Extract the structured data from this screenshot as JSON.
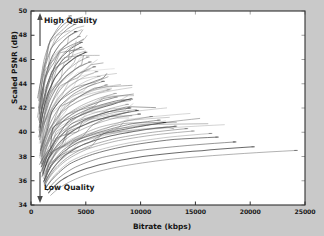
{
  "chart_data": {
    "type": "line",
    "title": "",
    "xlabel": "Bitrate (kbps)",
    "ylabel": "Scaled PSNR (dB)",
    "xlim": [
      0,
      25000
    ],
    "ylim": [
      34,
      50
    ],
    "xticks": [
      0,
      5000,
      10000,
      15000,
      20000,
      25000
    ],
    "yticks": [
      34,
      36,
      38,
      40,
      42,
      44,
      46,
      48,
      50
    ],
    "xtick_labels": [
      "0",
      "5000",
      "10000",
      "15000",
      "20000",
      "25000"
    ],
    "ytick_labels": [
      "34",
      "36",
      "38",
      "40",
      "42",
      "44",
      "46",
      "48",
      "50"
    ],
    "grid": false,
    "legend": null,
    "legend_position": "none",
    "line_color": "#555555",
    "plot_background": "#ffffff",
    "figure_background": "#c9c9c9",
    "annotations": [
      {
        "text": "High Quality",
        "x": 1400,
        "y": 49.0,
        "arrow": "up"
      },
      {
        "text": "Low Quality",
        "x": 1400,
        "y": 35.6,
        "arrow": "down"
      }
    ],
    "series": [
      {
        "name": "seq-01",
        "x": [
          700,
          900,
          1200,
          1700,
          2300,
          3000,
          3600
        ],
        "y": [
          42.6,
          44.4,
          46.0,
          47.4,
          48.4,
          49.2,
          49.6
        ]
      },
      {
        "name": "seq-02",
        "x": [
          700,
          950,
          1300,
          1800,
          2500,
          3300,
          4000
        ],
        "y": [
          42.0,
          43.8,
          45.4,
          46.8,
          47.8,
          48.5,
          48.9
        ]
      },
      {
        "name": "seq-03",
        "x": [
          750,
          1000,
          1400,
          1900,
          2600,
          3400,
          4100
        ],
        "y": [
          41.5,
          43.3,
          44.9,
          46.2,
          47.2,
          47.9,
          48.3
        ]
      },
      {
        "name": "seq-04",
        "x": [
          700,
          950,
          1350,
          1900,
          2700,
          3600,
          4400
        ],
        "y": [
          41.0,
          42.8,
          44.4,
          45.8,
          46.8,
          47.5,
          47.9
        ]
      },
      {
        "name": "seq-05",
        "x": [
          800,
          1100,
          1500,
          2100,
          2900,
          3800,
          4600
        ],
        "y": [
          40.8,
          42.5,
          44.0,
          45.3,
          46.3,
          47.0,
          47.4
        ]
      },
      {
        "name": "seq-06",
        "x": [
          750,
          1050,
          1450,
          2050,
          2850,
          3750,
          4550
        ],
        "y": [
          40.4,
          42.1,
          43.6,
          44.9,
          45.9,
          46.6,
          47.0
        ]
      },
      {
        "name": "seq-07",
        "x": [
          800,
          1100,
          1550,
          2200,
          3100,
          4100,
          5000
        ],
        "y": [
          40.0,
          41.7,
          43.2,
          44.5,
          45.5,
          46.2,
          46.6
        ]
      },
      {
        "name": "seq-08",
        "x": [
          850,
          1200,
          1700,
          2400,
          3300,
          4300,
          5200
        ],
        "y": [
          39.7,
          41.4,
          42.9,
          44.1,
          45.1,
          45.8,
          46.2
        ]
      },
      {
        "name": "seq-09",
        "x": [
          800,
          1150,
          1650,
          2350,
          3300,
          4400,
          5400
        ],
        "y": [
          39.4,
          41.0,
          42.5,
          43.7,
          44.7,
          45.4,
          45.8
        ]
      },
      {
        "name": "seq-10",
        "x": [
          850,
          1200,
          1750,
          2500,
          3500,
          4700,
          5800
        ],
        "y": [
          39.1,
          40.7,
          42.1,
          43.3,
          44.3,
          45.0,
          45.4
        ]
      },
      {
        "name": "seq-11",
        "x": [
          900,
          1300,
          1850,
          2650,
          3700,
          4900,
          6000
        ],
        "y": [
          38.8,
          40.4,
          41.8,
          43.0,
          43.9,
          44.6,
          45.0
        ]
      },
      {
        "name": "seq-12",
        "x": [
          850,
          1250,
          1800,
          2600,
          3700,
          5000,
          6200
        ],
        "y": [
          38.5,
          40.1,
          41.5,
          42.6,
          43.5,
          44.2,
          44.6
        ]
      },
      {
        "name": "seq-13",
        "x": [
          900,
          1350,
          1950,
          2800,
          3950,
          5300,
          6600
        ],
        "y": [
          38.2,
          39.8,
          41.1,
          42.3,
          43.2,
          43.8,
          44.2
        ]
      },
      {
        "name": "seq-14",
        "x": [
          950,
          1400,
          2050,
          2950,
          4150,
          5600,
          6900
        ],
        "y": [
          38.0,
          39.5,
          40.8,
          41.9,
          42.8,
          43.5,
          43.9
        ]
      },
      {
        "name": "seq-15",
        "x": [
          900,
          1350,
          2000,
          2900,
          4200,
          5700,
          7100
        ],
        "y": [
          37.8,
          39.3,
          40.6,
          41.7,
          42.5,
          43.1,
          43.5
        ]
      },
      {
        "name": "seq-16",
        "x": [
          1000,
          1500,
          2200,
          3200,
          4600,
          6200,
          7700
        ],
        "y": [
          37.6,
          39.1,
          40.3,
          41.4,
          42.2,
          42.8,
          43.2
        ]
      },
      {
        "name": "seq-17",
        "x": [
          950,
          1450,
          2150,
          3150,
          4550,
          6200,
          7800
        ],
        "y": [
          37.4,
          38.8,
          40.1,
          41.1,
          41.9,
          42.5,
          42.9
        ]
      },
      {
        "name": "seq-18",
        "x": [
          1000,
          1550,
          2300,
          3400,
          4900,
          6700,
          8400
        ],
        "y": [
          37.2,
          38.6,
          39.8,
          40.8,
          41.6,
          42.2,
          42.6
        ]
      },
      {
        "name": "seq-19",
        "x": [
          1050,
          1600,
          2400,
          3550,
          5150,
          7000,
          8800
        ],
        "y": [
          37.0,
          38.4,
          39.6,
          40.6,
          41.4,
          41.9,
          42.3
        ]
      },
      {
        "name": "seq-20",
        "x": [
          1000,
          1550,
          2350,
          3500,
          5100,
          7100,
          9000
        ],
        "y": [
          36.8,
          38.2,
          39.4,
          40.3,
          41.1,
          41.7,
          42.0
        ]
      },
      {
        "name": "seq-21",
        "x": [
          1100,
          1700,
          2550,
          3800,
          5600,
          7700,
          9700
        ],
        "y": [
          36.6,
          38.0,
          39.1,
          40.1,
          40.9,
          41.4,
          41.8
        ]
      },
      {
        "name": "seq-22",
        "x": [
          1050,
          1650,
          2500,
          3750,
          5600,
          7800,
          9900
        ],
        "y": [
          36.4,
          37.8,
          38.9,
          39.8,
          40.6,
          41.2,
          41.5
        ]
      },
      {
        "name": "seq-23",
        "x": [
          1150,
          1800,
          2750,
          4150,
          6200,
          8600,
          11000
        ],
        "y": [
          36.2,
          37.6,
          38.7,
          39.6,
          40.4,
          40.9,
          41.3
        ]
      },
      {
        "name": "seq-24",
        "x": [
          1200,
          1900,
          2900,
          4400,
          6600,
          9200,
          11700
        ],
        "y": [
          36.0,
          37.4,
          38.5,
          39.4,
          40.1,
          40.7,
          41.0
        ]
      },
      {
        "name": "seq-25",
        "x": [
          1150,
          1850,
          2850,
          4400,
          6700,
          9500,
          12200
        ],
        "y": [
          35.9,
          37.2,
          38.3,
          39.2,
          39.9,
          40.4,
          40.8
        ]
      },
      {
        "name": "seq-26",
        "x": [
          1250,
          2000,
          3100,
          4800,
          7300,
          10300,
          13200
        ],
        "y": [
          35.8,
          37.0,
          38.1,
          39.0,
          39.7,
          40.2,
          40.5
        ]
      },
      {
        "name": "seq-27",
        "x": [
          1300,
          2100,
          3300,
          5100,
          7800,
          11100,
          14200
        ],
        "y": [
          35.7,
          36.9,
          37.9,
          38.8,
          39.5,
          40.0,
          40.3
        ]
      },
      {
        "name": "seq-28",
        "x": [
          1250,
          2050,
          3250,
          5100,
          7900,
          11400,
          14800
        ],
        "y": [
          35.6,
          36.7,
          37.7,
          38.6,
          39.3,
          39.8,
          40.1
        ]
      },
      {
        "name": "seq-29",
        "x": [
          1400,
          2300,
          3600,
          5700,
          8800,
          12600,
          16400
        ],
        "y": [
          35.5,
          36.6,
          37.6,
          38.4,
          39.1,
          39.6,
          39.9
        ]
      },
      {
        "name": "seq-30",
        "x": [
          1350,
          2250,
          3550,
          5700,
          8900,
          12900,
          17000
        ],
        "y": [
          35.4,
          36.4,
          37.4,
          38.2,
          38.9,
          39.4,
          39.6
        ]
      },
      {
        "name": "seq-31",
        "x": [
          1500,
          2500,
          4000,
          6400,
          9900,
          14200,
          18600
        ],
        "y": [
          35.2,
          36.2,
          37.1,
          37.9,
          38.5,
          38.9,
          39.2
        ]
      },
      {
        "name": "seq-32",
        "x": [
          1600,
          2700,
          4400,
          7100,
          11000,
          15800,
          20300
        ],
        "y": [
          35.0,
          36.0,
          36.8,
          37.5,
          38.1,
          38.5,
          38.8
        ]
      },
      {
        "name": "seq-33",
        "x": [
          1800,
          3100,
          5100,
          8300,
          13000,
          18600,
          24200
        ],
        "y": [
          34.8,
          35.7,
          36.5,
          37.2,
          37.8,
          38.2,
          38.5
        ]
      }
    ]
  }
}
